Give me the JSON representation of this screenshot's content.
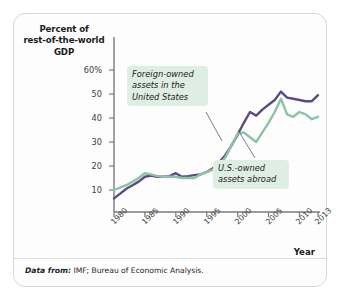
{
  "figure": {
    "y_axis_title": "Percent of rest-of-the-world GDP",
    "y_axis_title_lines": [
      "Percent of",
      "rest-of-the-world",
      "GDP"
    ],
    "x_axis_title": "Year",
    "source_lead": "Data from:",
    "source_rest": " IMF; Bureau of Economic Analysis.",
    "source_note": "Data from: IMF; Bureau of Economic Analysis."
  },
  "colors": {
    "foreign_owned_line": "#5c4a85",
    "us_owned_line": "#8cc3a6",
    "callout_background": "#dfeee4",
    "axis": "#7a7a7a",
    "card_border": "#d8d8d8",
    "text": "#1a1a1a"
  },
  "callouts": [
    {
      "id": "foreign-owned",
      "lines": [
        "Foreign-owned",
        "assets in the",
        "United States"
      ],
      "text": "Foreign-owned assets in the United States"
    },
    {
      "id": "us-owned",
      "lines": [
        "U.S.-owned",
        "assets abroad"
      ],
      "text": "U.S.-owned assets abroad"
    }
  ],
  "chart_data": {
    "type": "line",
    "title": "",
    "subtitle": "",
    "xlabel": "Year",
    "ylabel": "Percent of rest-of-the-world GDP",
    "xlim": [
      1980,
      2013
    ],
    "ylim": [
      0,
      62
    ],
    "grid": false,
    "legend": "annotated callouts on plot",
    "ytick_labels": [
      "60%",
      "50",
      "40",
      "30",
      "20",
      "10"
    ],
    "ytick_values": [
      60,
      50,
      40,
      30,
      20,
      10
    ],
    "xtick_labels": [
      "1980",
      "1985",
      "1990",
      "1995",
      "2000",
      "2005",
      "2010",
      "2013"
    ],
    "xtick_values": [
      1980,
      1985,
      1990,
      1995,
      2000,
      2005,
      2010,
      2013
    ],
    "x": [
      1980,
      1981,
      1982,
      1983,
      1984,
      1985,
      1986,
      1987,
      1988,
      1989,
      1990,
      1991,
      1992,
      1993,
      1994,
      1995,
      1996,
      1997,
      1998,
      1999,
      2000,
      2001,
      2002,
      2003,
      2004,
      2005,
      2006,
      2007,
      2008,
      2009,
      2010,
      2011,
      2012,
      2013
    ],
    "series": [
      {
        "name": "Foreign-owned assets in the United States",
        "color": "#5c4a85",
        "values": [
          6.5,
          8.5,
          10.5,
          12.0,
          13.5,
          15.5,
          16.0,
          15.5,
          15.5,
          15.8,
          17.0,
          15.5,
          15.8,
          16.2,
          16.5,
          17.5,
          19.0,
          21.5,
          24.5,
          28.5,
          33.0,
          38.0,
          42.5,
          41.0,
          43.5,
          45.5,
          47.5,
          51.0,
          48.5,
          48.0,
          47.5,
          47.0,
          47.0,
          49.5
        ]
      },
      {
        "name": "U.S.-owned assets abroad",
        "color": "#8cc3a6",
        "values": [
          10.0,
          11.0,
          12.0,
          13.5,
          15.0,
          17.0,
          16.5,
          15.8,
          15.5,
          15.5,
          15.5,
          15.0,
          15.0,
          15.0,
          16.5,
          17.5,
          18.5,
          20.5,
          23.5,
          28.5,
          33.5,
          34.0,
          32.0,
          30.0,
          34.0,
          38.0,
          42.5,
          48.0,
          41.5,
          40.5,
          42.5,
          41.5,
          39.5,
          40.5
        ]
      }
    ]
  }
}
